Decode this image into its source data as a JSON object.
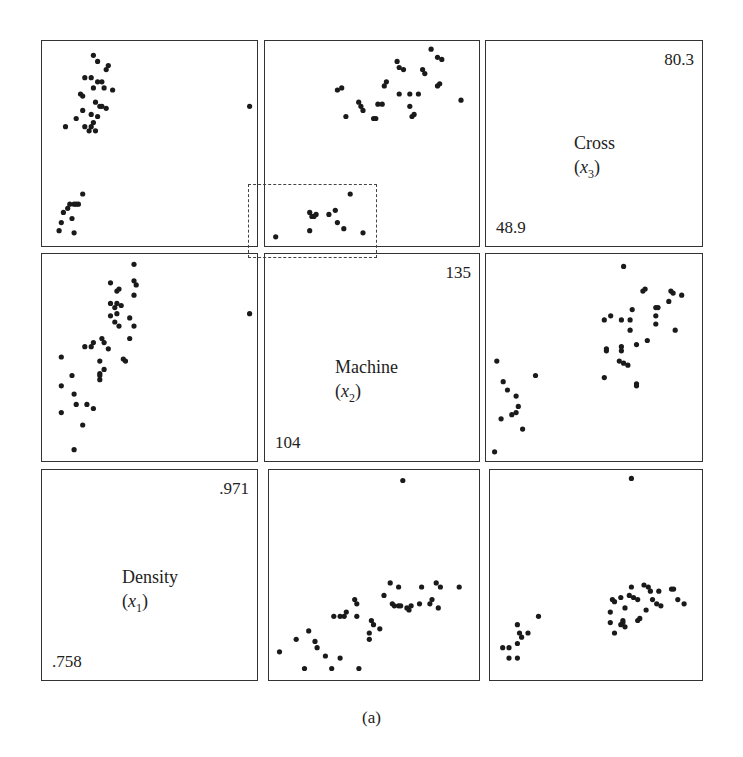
{
  "figure": {
    "caption": "(a)",
    "variables": [
      {
        "name": "Density",
        "symbol": "x",
        "sub": "1",
        "min_label": ".758",
        "max_label": ".971"
      },
      {
        "name": "Machine",
        "symbol": "x",
        "sub": "2",
        "min_label": "104",
        "max_label": "135"
      },
      {
        "name": "Cross",
        "symbol": "x",
        "sub": "3",
        "min_label": "48.9",
        "max_label": "80.3"
      }
    ],
    "highlight": "dashed rectangle around low-value cluster in Machine-vs-Cross panel"
  },
  "chart_data": {
    "type": "scatter",
    "layout": "3x3 scatterplot matrix, diagonal panels hold variable names and ranges",
    "variables": [
      "Density (x1)",
      "Machine (x2)",
      "Cross (x3)"
    ],
    "ranges": {
      "Density": [
        0.758,
        0.971
      ],
      "Machine": [
        104,
        135
      ],
      "Cross": [
        48.9,
        80.3
      ]
    },
    "panels": [
      {
        "row": 1,
        "col": 1,
        "x": "Density",
        "y": "Cross",
        "points_norm": [
          [
            0.24,
            0.93
          ],
          [
            0.26,
            0.9
          ],
          [
            0.31,
            0.88
          ],
          [
            0.3,
            0.86
          ],
          [
            0.2,
            0.82
          ],
          [
            0.23,
            0.82
          ],
          [
            0.26,
            0.8
          ],
          [
            0.28,
            0.8
          ],
          [
            0.24,
            0.77
          ],
          [
            0.29,
            0.77
          ],
          [
            0.33,
            0.76
          ],
          [
            0.18,
            0.74
          ],
          [
            0.19,
            0.73
          ],
          [
            0.25,
            0.7
          ],
          [
            0.27,
            0.68
          ],
          [
            0.28,
            0.68
          ],
          [
            0.3,
            0.67
          ],
          [
            0.19,
            0.66
          ],
          [
            0.23,
            0.64
          ],
          [
            0.26,
            0.63
          ],
          [
            0.16,
            0.62
          ],
          [
            0.2,
            0.58
          ],
          [
            0.23,
            0.58
          ],
          [
            0.24,
            0.6
          ],
          [
            0.22,
            0.56
          ],
          [
            0.25,
            0.56
          ],
          [
            0.11,
            0.58
          ],
          [
            0.97,
            0.68
          ],
          [
            0.19,
            0.25
          ],
          [
            0.15,
            0.2
          ],
          [
            0.12,
            0.18
          ],
          [
            0.13,
            0.2
          ],
          [
            0.1,
            0.16
          ],
          [
            0.09,
            0.11
          ],
          [
            0.08,
            0.07
          ],
          [
            0.14,
            0.13
          ],
          [
            0.15,
            0.06
          ],
          [
            0.16,
            0.2
          ],
          [
            0.17,
            0.2
          ]
        ]
      },
      {
        "row": 1,
        "col": 2,
        "x": "Machine",
        "y": "Cross",
        "points_norm": [
          [
            0.62,
            0.9
          ],
          [
            0.78,
            0.96
          ],
          [
            0.81,
            0.92
          ],
          [
            0.83,
            0.91
          ],
          [
            0.74,
            0.86
          ],
          [
            0.75,
            0.84
          ],
          [
            0.63,
            0.87
          ],
          [
            0.65,
            0.86
          ],
          [
            0.57,
            0.8
          ],
          [
            0.56,
            0.78
          ],
          [
            0.82,
            0.79
          ],
          [
            0.81,
            0.78
          ],
          [
            0.34,
            0.76
          ],
          [
            0.36,
            0.77
          ],
          [
            0.44,
            0.7
          ],
          [
            0.45,
            0.68
          ],
          [
            0.46,
            0.66
          ],
          [
            0.53,
            0.69
          ],
          [
            0.55,
            0.69
          ],
          [
            0.63,
            0.74
          ],
          [
            0.68,
            0.74
          ],
          [
            0.72,
            0.74
          ],
          [
            0.68,
            0.68
          ],
          [
            0.69,
            0.63
          ],
          [
            0.7,
            0.64
          ],
          [
            0.38,
            0.63
          ],
          [
            0.51,
            0.62
          ],
          [
            0.52,
            0.62
          ],
          [
            0.92,
            0.71
          ],
          [
            0.4,
            0.25
          ],
          [
            0.33,
            0.17
          ],
          [
            0.21,
            0.16
          ],
          [
            0.22,
            0.14
          ],
          [
            0.23,
            0.14
          ],
          [
            0.24,
            0.15
          ],
          [
            0.3,
            0.15
          ],
          [
            0.34,
            0.11
          ],
          [
            0.37,
            0.08
          ],
          [
            0.21,
            0.07
          ],
          [
            0.46,
            0.06
          ],
          [
            0.05,
            0.04
          ]
        ]
      },
      {
        "row": 2,
        "col": 1,
        "x": "Density",
        "y": "Machine",
        "points_norm": [
          [
            0.43,
            0.95
          ],
          [
            0.32,
            0.86
          ],
          [
            0.43,
            0.87
          ],
          [
            0.44,
            0.85
          ],
          [
            0.35,
            0.82
          ],
          [
            0.36,
            0.83
          ],
          [
            0.43,
            0.8
          ],
          [
            0.32,
            0.76
          ],
          [
            0.35,
            0.76
          ],
          [
            0.34,
            0.74
          ],
          [
            0.37,
            0.75
          ],
          [
            0.32,
            0.7
          ],
          [
            0.35,
            0.71
          ],
          [
            0.41,
            0.69
          ],
          [
            0.34,
            0.67
          ],
          [
            0.36,
            0.65
          ],
          [
            0.43,
            0.65
          ],
          [
            0.41,
            0.59
          ],
          [
            0.28,
            0.59
          ],
          [
            0.29,
            0.57
          ],
          [
            0.24,
            0.57
          ],
          [
            0.23,
            0.55
          ],
          [
            0.31,
            0.54
          ],
          [
            0.2,
            0.55
          ],
          [
            0.38,
            0.49
          ],
          [
            0.39,
            0.48
          ],
          [
            0.27,
            0.48
          ],
          [
            0.09,
            0.5
          ],
          [
            0.29,
            0.44
          ],
          [
            0.27,
            0.42
          ],
          [
            0.27,
            0.41
          ],
          [
            0.27,
            0.39
          ],
          [
            0.14,
            0.41
          ],
          [
            0.09,
            0.36
          ],
          [
            0.15,
            0.32
          ],
          [
            0.16,
            0.27
          ],
          [
            0.21,
            0.27
          ],
          [
            0.24,
            0.25
          ],
          [
            0.09,
            0.23
          ],
          [
            0.19,
            0.17
          ],
          [
            0.15,
            0.05
          ],
          [
            0.97,
            0.71
          ]
        ]
      },
      {
        "row": 2,
        "col": 3,
        "x": "Cross",
        "y": "Machine",
        "points_norm": [
          [
            0.64,
            0.94
          ],
          [
            0.74,
            0.83
          ],
          [
            0.73,
            0.82
          ],
          [
            0.86,
            0.82
          ],
          [
            0.87,
            0.81
          ],
          [
            0.91,
            0.8
          ],
          [
            0.85,
            0.77
          ],
          [
            0.79,
            0.74
          ],
          [
            0.8,
            0.74
          ],
          [
            0.68,
            0.73
          ],
          [
            0.58,
            0.7
          ],
          [
            0.55,
            0.68
          ],
          [
            0.63,
            0.68
          ],
          [
            0.67,
            0.68
          ],
          [
            0.79,
            0.7
          ],
          [
            0.79,
            0.66
          ],
          [
            0.67,
            0.63
          ],
          [
            0.88,
            0.63
          ],
          [
            0.75,
            0.58
          ],
          [
            0.7,
            0.56
          ],
          [
            0.56,
            0.54
          ],
          [
            0.56,
            0.53
          ],
          [
            0.63,
            0.55
          ],
          [
            0.63,
            0.53
          ],
          [
            0.62,
            0.48
          ],
          [
            0.64,
            0.47
          ],
          [
            0.66,
            0.46
          ],
          [
            0.55,
            0.4
          ],
          [
            0.7,
            0.37
          ],
          [
            0.7,
            0.36
          ],
          [
            0.05,
            0.48
          ],
          [
            0.23,
            0.41
          ],
          [
            0.08,
            0.38
          ],
          [
            0.1,
            0.34
          ],
          [
            0.14,
            0.31
          ],
          [
            0.15,
            0.26
          ],
          [
            0.14,
            0.23
          ],
          [
            0.12,
            0.22
          ],
          [
            0.07,
            0.2
          ],
          [
            0.17,
            0.15
          ],
          [
            0.04,
            0.04
          ]
        ]
      },
      {
        "row": 3,
        "col": 2,
        "x": "Machine",
        "y": "Density",
        "points_norm": [
          [
            0.64,
            0.95
          ],
          [
            0.58,
            0.46
          ],
          [
            0.62,
            0.44
          ],
          [
            0.73,
            0.44
          ],
          [
            0.8,
            0.46
          ],
          [
            0.82,
            0.44
          ],
          [
            0.91,
            0.44
          ],
          [
            0.41,
            0.38
          ],
          [
            0.42,
            0.36
          ],
          [
            0.55,
            0.4
          ],
          [
            0.59,
            0.36
          ],
          [
            0.6,
            0.35
          ],
          [
            0.62,
            0.35
          ],
          [
            0.63,
            0.35
          ],
          [
            0.66,
            0.34
          ],
          [
            0.67,
            0.33
          ],
          [
            0.68,
            0.35
          ],
          [
            0.72,
            0.36
          ],
          [
            0.77,
            0.36
          ],
          [
            0.78,
            0.38
          ],
          [
            0.81,
            0.34
          ],
          [
            0.31,
            0.3
          ],
          [
            0.34,
            0.3
          ],
          [
            0.36,
            0.3
          ],
          [
            0.37,
            0.32
          ],
          [
            0.42,
            0.3
          ],
          [
            0.49,
            0.28
          ],
          [
            0.5,
            0.26
          ],
          [
            0.53,
            0.24
          ],
          [
            0.48,
            0.22
          ],
          [
            0.48,
            0.19
          ],
          [
            0.19,
            0.23
          ],
          [
            0.22,
            0.18
          ],
          [
            0.23,
            0.15
          ],
          [
            0.13,
            0.19
          ],
          [
            0.05,
            0.13
          ],
          [
            0.27,
            0.11
          ],
          [
            0.34,
            0.1
          ],
          [
            0.17,
            0.05
          ],
          [
            0.3,
            0.05
          ],
          [
            0.43,
            0.05
          ]
        ]
      },
      {
        "row": 3,
        "col": 3,
        "x": "Cross",
        "y": "Density",
        "points_norm": [
          [
            0.67,
            0.96
          ],
          [
            0.67,
            0.44
          ],
          [
            0.73,
            0.45
          ],
          [
            0.75,
            0.44
          ],
          [
            0.76,
            0.42
          ],
          [
            0.8,
            0.42
          ],
          [
            0.86,
            0.43
          ],
          [
            0.87,
            0.43
          ],
          [
            0.58,
            0.38
          ],
          [
            0.59,
            0.37
          ],
          [
            0.62,
            0.39
          ],
          [
            0.66,
            0.4
          ],
          [
            0.68,
            0.39
          ],
          [
            0.7,
            0.38
          ],
          [
            0.77,
            0.38
          ],
          [
            0.79,
            0.36
          ],
          [
            0.81,
            0.35
          ],
          [
            0.89,
            0.38
          ],
          [
            0.92,
            0.36
          ],
          [
            0.64,
            0.34
          ],
          [
            0.74,
            0.33
          ],
          [
            0.57,
            0.32
          ],
          [
            0.7,
            0.28
          ],
          [
            0.71,
            0.29
          ],
          [
            0.57,
            0.27
          ],
          [
            0.62,
            0.26
          ],
          [
            0.63,
            0.28
          ],
          [
            0.63,
            0.27
          ],
          [
            0.64,
            0.25
          ],
          [
            0.59,
            0.22
          ],
          [
            0.23,
            0.3
          ],
          [
            0.13,
            0.26
          ],
          [
            0.14,
            0.22
          ],
          [
            0.18,
            0.22
          ],
          [
            0.15,
            0.2
          ],
          [
            0.13,
            0.17
          ],
          [
            0.06,
            0.15
          ],
          [
            0.09,
            0.15
          ],
          [
            0.09,
            0.1
          ],
          [
            0.13,
            0.1
          ]
        ]
      }
    ]
  }
}
